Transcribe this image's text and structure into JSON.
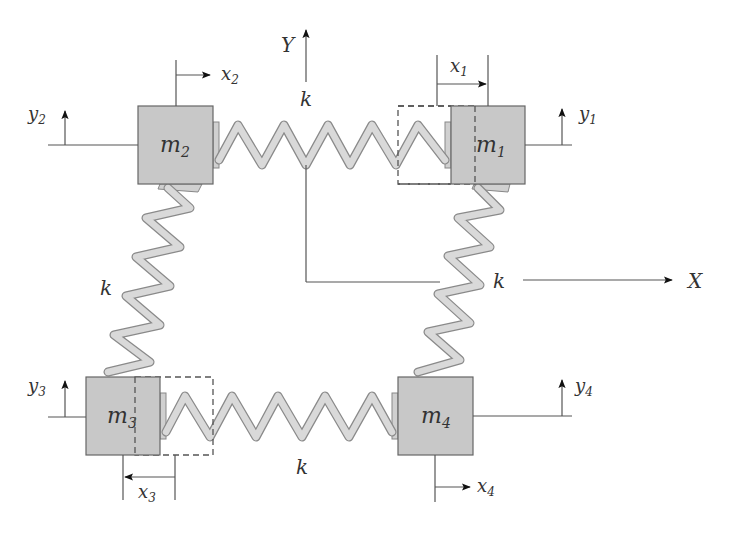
{
  "diagram": {
    "colors": {
      "mass_fill": "#c8c8c8",
      "mass_stroke": "#666666",
      "spring_fill": "#d9d9d9",
      "spring_outline": "#8a8a8a",
      "line": "#555555",
      "text": "#333333"
    },
    "axes": {
      "x_label": "X",
      "y_label": "Y"
    },
    "masses": [
      {
        "id": "m1",
        "base": "m",
        "sub": "1"
      },
      {
        "id": "m2",
        "base": "m",
        "sub": "2"
      },
      {
        "id": "m3",
        "base": "m",
        "sub": "3"
      },
      {
        "id": "m4",
        "base": "m",
        "sub": "4"
      }
    ],
    "displacements": [
      {
        "id": "x1",
        "base": "x",
        "sub": "1"
      },
      {
        "id": "x2",
        "base": "x",
        "sub": "2"
      },
      {
        "id": "x3",
        "base": "x",
        "sub": "3"
      },
      {
        "id": "x4",
        "base": "x",
        "sub": "4"
      },
      {
        "id": "y1",
        "base": "y",
        "sub": "1"
      },
      {
        "id": "y2",
        "base": "y",
        "sub": "2"
      },
      {
        "id": "y3",
        "base": "y",
        "sub": "3"
      },
      {
        "id": "y4",
        "base": "y",
        "sub": "4"
      }
    ],
    "springs": [
      {
        "id": "top",
        "label": "k",
        "connects": "m2-m1"
      },
      {
        "id": "left",
        "label": "k",
        "connects": "m2-m3"
      },
      {
        "id": "right",
        "label": "k",
        "connects": "m1-m4"
      },
      {
        "id": "bottom",
        "label": "k",
        "connects": "m3-m4"
      }
    ]
  }
}
